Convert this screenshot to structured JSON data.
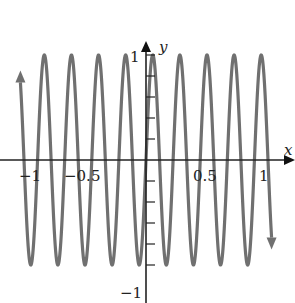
{
  "chart_data": {
    "type": "line",
    "title": "",
    "function": "y = sin(27x)",
    "xlabel": "x",
    "ylabel": "y",
    "xlim": [
      -1.1,
      1.1
    ],
    "ylim": [
      -1,
      1
    ],
    "x_ticks": [
      -1,
      -0.5,
      0.5,
      1
    ],
    "x_tick_labels": [
      "−1",
      "−0.5",
      "0.5",
      "1"
    ],
    "y_ticks": [
      1,
      -1
    ],
    "y_tick_labels": [
      "1",
      "−1"
    ],
    "y_minor_ticks": [
      -0.8,
      -0.6,
      -0.4,
      -0.2,
      0.2,
      0.4,
      0.6,
      0.8
    ],
    "grid": false,
    "curve_color": "#707070",
    "end_arrows": true
  },
  "labels": {
    "x_axis": "x",
    "y_axis": "y",
    "x_neg1": "−1",
    "x_neg05": "−0.5",
    "x_05": "0.5",
    "x_1": "1",
    "y_1": "1",
    "y_neg1": "−1"
  }
}
